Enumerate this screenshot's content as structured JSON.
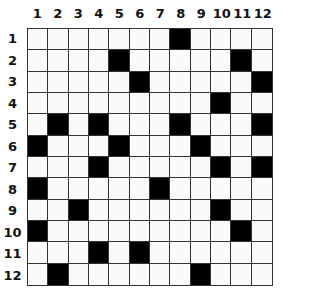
{
  "puzzle": {
    "rows": 12,
    "cols": 12,
    "col_labels": [
      "1",
      "2",
      "3",
      "4",
      "5",
      "6",
      "7",
      "8",
      "9",
      "10",
      "11",
      "12"
    ],
    "row_labels": [
      "1",
      "2",
      "3",
      "4",
      "5",
      "6",
      "7",
      "8",
      "9",
      "10",
      "11",
      "12"
    ],
    "black_cells": [
      [
        1,
        8
      ],
      [
        2,
        5
      ],
      [
        2,
        11
      ],
      [
        3,
        6
      ],
      [
        3,
        12
      ],
      [
        4,
        10
      ],
      [
        5,
        2
      ],
      [
        5,
        4
      ],
      [
        5,
        8
      ],
      [
        5,
        12
      ],
      [
        6,
        1
      ],
      [
        6,
        5
      ],
      [
        6,
        9
      ],
      [
        7,
        4
      ],
      [
        7,
        10
      ],
      [
        7,
        12
      ],
      [
        8,
        1
      ],
      [
        8,
        7
      ],
      [
        9,
        3
      ],
      [
        9,
        10
      ],
      [
        10,
        1
      ],
      [
        10,
        11
      ],
      [
        11,
        4
      ],
      [
        11,
        6
      ],
      [
        12,
        2
      ],
      [
        12,
        9
      ]
    ]
  }
}
